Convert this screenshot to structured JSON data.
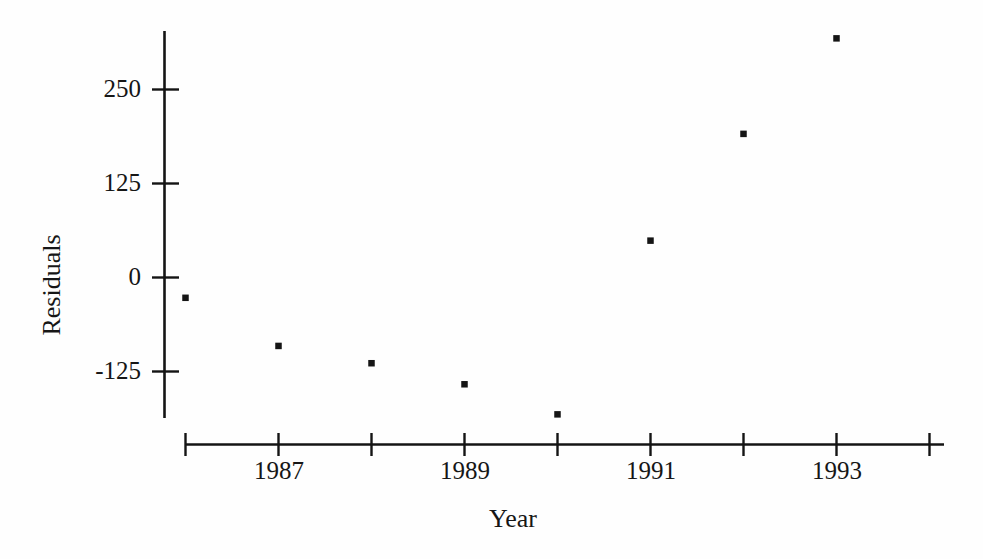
{
  "chart_data": {
    "type": "scatter",
    "title": "",
    "xlabel": "Year",
    "ylabel": "Residuals",
    "x": [
      1986,
      1987,
      1988,
      1989,
      1990,
      1991,
      1992,
      1993
    ],
    "values": [
      -27,
      -91,
      -114,
      -142,
      -182,
      49,
      191,
      318
    ],
    "series": [
      {
        "name": "Residuals",
        "points": [
          {
            "x": 1986,
            "y": -27
          },
          {
            "x": 1987,
            "y": -91
          },
          {
            "x": 1988,
            "y": -114
          },
          {
            "x": 1989,
            "y": -142
          },
          {
            "x": 1990,
            "y": -182
          },
          {
            "x": 1991,
            "y": 49
          },
          {
            "x": 1992,
            "y": 191
          },
          {
            "x": 1993,
            "y": 318
          }
        ]
      }
    ],
    "xlim": [
      1985.5,
      1994.5
    ],
    "ylim": [
      -190,
      340
    ],
    "x_ticks": [
      1986,
      1987,
      1988,
      1989,
      1990,
      1991,
      1992,
      1993,
      1994
    ],
    "x_tick_labels": [
      "",
      "1987",
      "",
      "1989",
      "",
      "1991",
      "",
      "1993",
      ""
    ],
    "y_ticks": [
      -125,
      0,
      125,
      250
    ],
    "y_tick_labels": [
      "-125",
      "0",
      "125",
      "250"
    ],
    "grid": false,
    "legend": false,
    "marker": "square",
    "marker_color": "#151515",
    "axis_color": "#141414",
    "background_color": "#ffffff"
  },
  "axis": {
    "y_title": "Residuals",
    "x_title": "Year"
  },
  "y_tick_labels": [
    {
      "text": "250"
    },
    {
      "text": "125"
    },
    {
      "text": "0"
    },
    {
      "text": "-125"
    }
  ],
  "x_tick_labels": [
    {
      "text": "1987"
    },
    {
      "text": "1989"
    },
    {
      "text": "1991"
    },
    {
      "text": "1993"
    }
  ]
}
